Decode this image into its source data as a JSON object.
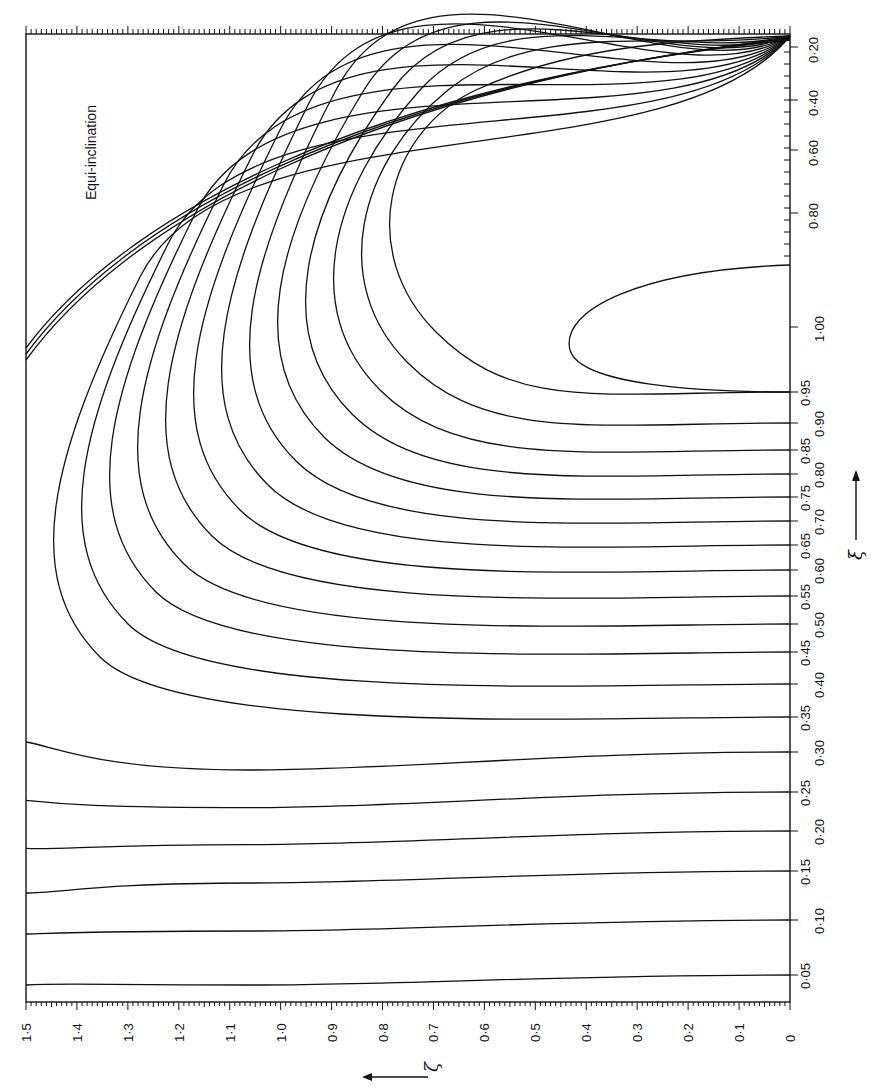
{
  "chart_data": {
    "type": "line",
    "title": "",
    "annotation": "Equi-inclination",
    "orientation": "rotated 90° (page printed sideways)",
    "xlabel": "ξ",
    "ylabel": "ζ",
    "zeta_axis": {
      "symbol": "ζ",
      "range": [
        0,
        1.5
      ],
      "tick_labels": [
        "1·5",
        "1·4",
        "1·3",
        "1·2",
        "1·1",
        "1·0",
        "0·9",
        "0·8",
        "0·7",
        "0·6",
        "0·5",
        "0·4",
        "0·3",
        "0·2",
        "0·1",
        "0"
      ],
      "tick_values": [
        1.5,
        1.4,
        1.3,
        1.2,
        1.1,
        1.0,
        0.9,
        0.8,
        0.7,
        0.6,
        0.5,
        0.4,
        0.3,
        0.2,
        0.1,
        0
      ]
    },
    "xi_axis": {
      "symbol": "ξ",
      "tick_labels_inner": [
        "0·05",
        "0·15",
        "0·25",
        "0·35",
        "0·45",
        "0·55",
        "0·65",
        "0·75",
        "0·85",
        "0·95"
      ],
      "tick_labels_outer": [
        "0·10",
        "0·20",
        "0·30",
        "0·40",
        "0·50",
        "0·60",
        "0·70",
        "0·80",
        "0·90",
        "1·00"
      ],
      "upper_scale_labels": [
        "0·20",
        "0·40",
        "0·60",
        "0·80"
      ]
    },
    "series": [
      {
        "name": "0.05",
        "end_y": 975,
        "left_y": 985,
        "bend": 0
      },
      {
        "name": "0.10",
        "end_y": 920,
        "left_y": 935,
        "bend": 0.05
      },
      {
        "name": "0.15",
        "end_y": 871,
        "left_y": 895,
        "bend": 0.1
      },
      {
        "name": "0.20",
        "end_y": 831,
        "left_y": 852,
        "bend": 0.18
      },
      {
        "name": "0.25",
        "end_y": 792,
        "left_y": 806,
        "bend": 0.28
      },
      {
        "name": "0.30",
        "end_y": 752,
        "left_y": 750,
        "bend": 0.4
      },
      {
        "name": "0.35",
        "end_y": 717,
        "left_y": 695,
        "bend": 0.55
      },
      {
        "name": "0.40",
        "end_y": 684,
        "left_y": 655,
        "bend": 0.7
      },
      {
        "name": "0.45",
        "end_y": 652,
        "left_y": 600,
        "bend": 0.85
      },
      {
        "name": "0.50",
        "end_y": 624,
        "left_y": 555,
        "bend": 1.0
      },
      {
        "name": "0.55",
        "end_y": 596,
        "left_y": 505,
        "bend": 1.0
      },
      {
        "name": "0.60",
        "end_y": 570,
        "left_y": 455,
        "bend": 1.0
      },
      {
        "name": "0.65",
        "end_y": 545,
        "left_y": 405,
        "bend": 1.0
      },
      {
        "name": "0.70",
        "end_y": 521,
        "left_y": 370,
        "bend": 1.0
      },
      {
        "name": "0.75",
        "end_y": 497,
        "left_y": 345,
        "bend": 1.0
      },
      {
        "name": "0.80",
        "end_y": 474,
        "left_y": 335,
        "bend": 1.0
      },
      {
        "name": "0.85",
        "end_y": 450,
        "left_y": 328,
        "bend": 1.0
      },
      {
        "name": "0.90",
        "end_y": 423,
        "left_y": 322,
        "bend": 1.0
      },
      {
        "name": "0.95",
        "end_y": 392,
        "left_y": 300,
        "bend": 1.0
      }
    ],
    "grid": false,
    "legend": "none"
  }
}
